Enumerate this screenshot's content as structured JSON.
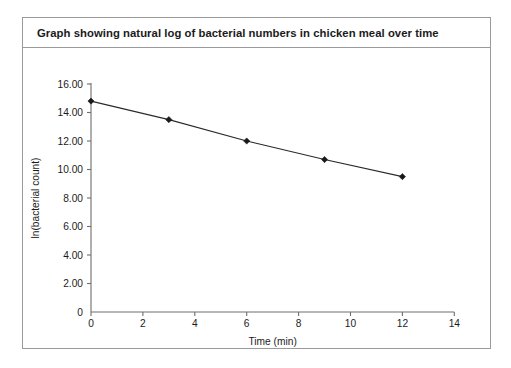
{
  "figure": {
    "title": "Graph showing natural log of bacterial numbers in chicken meal over time"
  },
  "chart_data": {
    "type": "line",
    "title": "Graph showing natural log of bacterial numbers in chicken meal over time",
    "xlabel": "Time (min)",
    "ylabel": "ln(bacterial count)",
    "x": [
      0,
      3,
      6,
      9,
      12
    ],
    "values": [
      14.8,
      13.5,
      12.0,
      10.7,
      9.5
    ],
    "series": [
      {
        "name": "ln(bacterial count)",
        "values": [
          14.8,
          13.5,
          12.0,
          10.7,
          9.5
        ]
      }
    ],
    "xlim": [
      0,
      14
    ],
    "ylim": [
      0,
      16
    ],
    "xticks": [
      0,
      2,
      4,
      6,
      8,
      10,
      12,
      14
    ],
    "xtick_labels": [
      "0",
      "2",
      "4",
      "6",
      "8",
      "10",
      "12",
      "14"
    ],
    "yticks": [
      0,
      2,
      4,
      6,
      8,
      10,
      12,
      14,
      16
    ],
    "ytick_labels": [
      "0",
      "2.00",
      "4.00",
      "6.00",
      "8.00",
      "10.00",
      "12.00",
      "14.00",
      "16.00"
    ],
    "grid": false,
    "legend": false,
    "marker": "diamond",
    "line_color": "#2a2a2a",
    "marker_color": "#1a1a1a"
  }
}
